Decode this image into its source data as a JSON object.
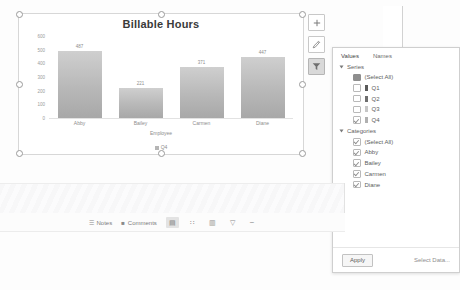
{
  "chart_data": {
    "type": "bar",
    "title": "Billable Hours",
    "categories": [
      "Abby",
      "Bailey",
      "Carmen",
      "Diane"
    ],
    "values": [
      487,
      221,
      371,
      447
    ],
    "labels": [
      "487",
      "221",
      "371",
      "447"
    ],
    "series": [
      {
        "name": "Q4",
        "values": [
          487,
          221,
          371,
          447
        ]
      }
    ],
    "xlabel": "Employee",
    "ylabel": "",
    "ylim": [
      0,
      600
    ],
    "yticks": [
      "600",
      "500",
      "400",
      "300",
      "200",
      "100",
      "0"
    ],
    "ytick_values": [
      600,
      500,
      400,
      300,
      200,
      100,
      0
    ],
    "legend": [
      "Q4"
    ],
    "legend_position": "bottom",
    "grid": false,
    "bar_color": "#b8b8b8"
  },
  "chart_buttons": [
    {
      "name": "chart-elements",
      "glyph": "+"
    },
    {
      "name": "chart-styles",
      "glyph": "✎"
    },
    {
      "name": "chart-filters",
      "glyph": "▼"
    }
  ],
  "filter_popup": {
    "tabs": [
      {
        "label": "Values",
        "active": true
      },
      {
        "label": "Names",
        "active": false
      }
    ],
    "sections": [
      {
        "name": "Series",
        "title": "Series",
        "rows": [
          {
            "label": "(Select All)",
            "state": "mixed",
            "swatch": ""
          },
          {
            "label": "Q1",
            "state": "unchecked",
            "swatch": "#5a5a5a"
          },
          {
            "label": "Q2",
            "state": "unchecked",
            "swatch": "#6e6e6e"
          },
          {
            "label": "Q3",
            "state": "unchecked",
            "swatch": "#c6c6c6"
          },
          {
            "label": "Q4",
            "state": "checked",
            "swatch": "#b0b0b0"
          }
        ]
      },
      {
        "name": "Categories",
        "title": "Categories",
        "rows": [
          {
            "label": "(Select All)",
            "state": "checked",
            "swatch": ""
          },
          {
            "label": "Abby",
            "state": "checked",
            "swatch": ""
          },
          {
            "label": "Bailey",
            "state": "checked",
            "swatch": ""
          },
          {
            "label": "Carmen",
            "state": "checked",
            "swatch": ""
          },
          {
            "label": "Diane",
            "state": "checked",
            "swatch": ""
          }
        ]
      }
    ],
    "apply_label": "Apply",
    "select_data_label": "Select Data..."
  },
  "status_bar": {
    "notes_label": "Notes",
    "comments_label": "Comments",
    "view_buttons": [
      {
        "name": "normal-view",
        "glyph": "▤",
        "active": true
      },
      {
        "name": "slide-sorter-view",
        "glyph": "∷",
        "active": false
      },
      {
        "name": "reading-view",
        "glyph": "▥",
        "active": false
      },
      {
        "name": "slideshow-view",
        "glyph": "▽",
        "active": false
      }
    ],
    "zoom_out_glyph": "−"
  }
}
